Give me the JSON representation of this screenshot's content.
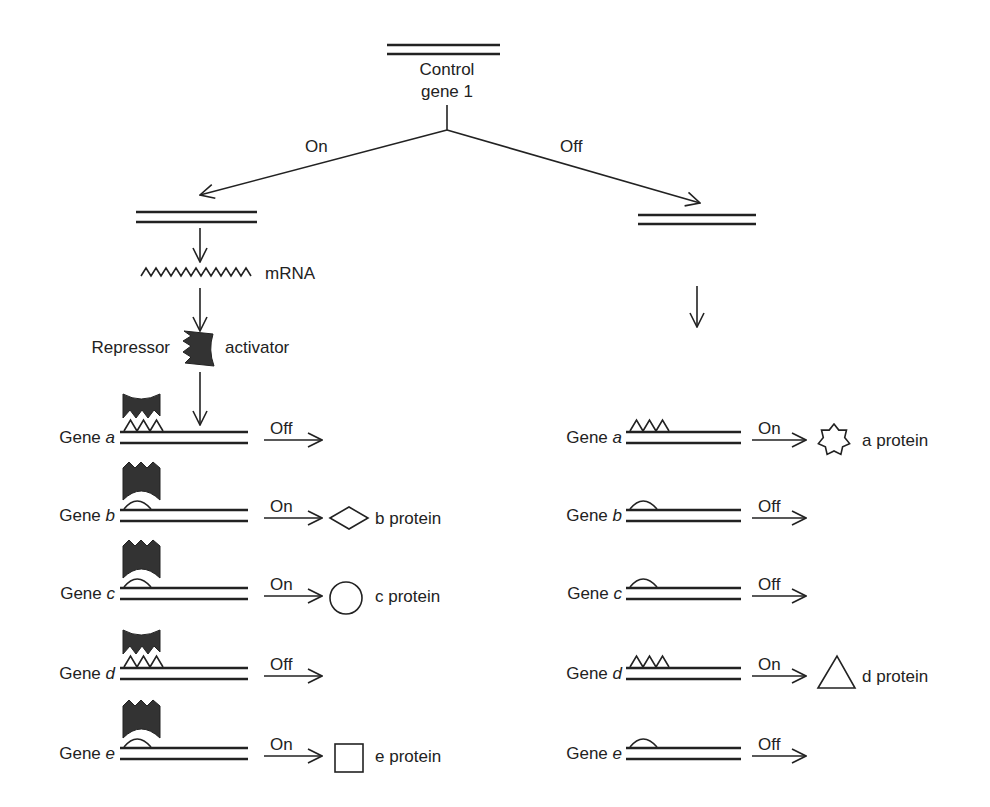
{
  "control_gene": {
    "line1": "Control",
    "line2": "gene 1"
  },
  "branches": {
    "on_label": "On",
    "off_label": "Off"
  },
  "left_pathway": {
    "mrna_label": "mRNA",
    "repressor_label": "Repressor",
    "activator_label": "activator"
  },
  "left_genes": [
    {
      "prefix": "Gene ",
      "letter": "a",
      "site": "triangles",
      "bound": "repressor",
      "state": "Off",
      "product_shape": "",
      "product_label": ""
    },
    {
      "prefix": "Gene ",
      "letter": "b",
      "site": "dome",
      "bound": "activator",
      "state": "On",
      "product_shape": "diamond",
      "product_label": "b protein"
    },
    {
      "prefix": "Gene ",
      "letter": "c",
      "site": "dome",
      "bound": "activator",
      "state": "On",
      "product_shape": "circle",
      "product_label": "c protein"
    },
    {
      "prefix": "Gene ",
      "letter": "d",
      "site": "triangles",
      "bound": "repressor",
      "state": "Off",
      "product_shape": "",
      "product_label": ""
    },
    {
      "prefix": "Gene ",
      "letter": "e",
      "site": "dome",
      "bound": "activator",
      "state": "On",
      "product_shape": "square",
      "product_label": "e protein"
    }
  ],
  "right_genes": [
    {
      "prefix": "Gene ",
      "letter": "a",
      "site": "triangles",
      "state": "On",
      "product_shape": "star",
      "product_label": "a protein"
    },
    {
      "prefix": "Gene ",
      "letter": "b",
      "site": "dome",
      "state": "Off",
      "product_shape": "",
      "product_label": ""
    },
    {
      "prefix": "Gene ",
      "letter": "c",
      "site": "dome",
      "state": "Off",
      "product_shape": "",
      "product_label": ""
    },
    {
      "prefix": "Gene ",
      "letter": "d",
      "site": "triangles",
      "state": "On",
      "product_shape": "triangle",
      "product_label": "d protein"
    },
    {
      "prefix": "Gene ",
      "letter": "e",
      "site": "dome",
      "state": "Off",
      "product_shape": "",
      "product_label": ""
    }
  ],
  "colors": {
    "ink": "#222222",
    "protein_fill": "#333333",
    "background": "#ffffff"
  }
}
